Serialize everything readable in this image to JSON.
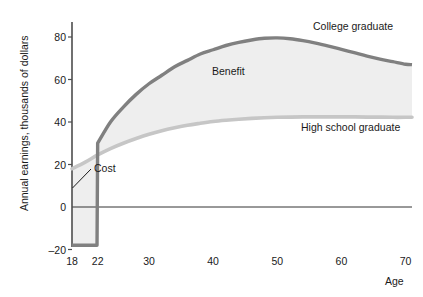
{
  "chart_data": {
    "type": "area",
    "title": "",
    "xlabel": "Age",
    "ylabel": "Annual earnings, thousands of dollars",
    "xlim": [
      18,
      71
    ],
    "ylim": [
      -20,
      85
    ],
    "grid": false,
    "legend_position": "inline-right",
    "xticks": [
      {
        "value": 18,
        "label": "18"
      },
      {
        "value": 22,
        "label": "22"
      },
      {
        "value": 30,
        "label": "30"
      },
      {
        "value": 40,
        "label": "40"
      },
      {
        "value": 50,
        "label": "50"
      },
      {
        "value": 60,
        "label": "60"
      },
      {
        "value": 70,
        "label": "70"
      }
    ],
    "yticks": [
      {
        "value": -20,
        "label": "–20"
      },
      {
        "value": 0,
        "label": "0"
      },
      {
        "value": 20,
        "label": "20"
      },
      {
        "value": 40,
        "label": "40"
      },
      {
        "value": 60,
        "label": "60"
      },
      {
        "value": 80,
        "label": "80"
      }
    ],
    "series": [
      {
        "name": "College graduate",
        "color": "#808080",
        "x": [
          18,
          19,
          20,
          21,
          21.9,
          22,
          24,
          26,
          28,
          30,
          32,
          34,
          36,
          38,
          40,
          42,
          44,
          46,
          48,
          50,
          52,
          54,
          56,
          58,
          60,
          62,
          64,
          66,
          68,
          70,
          71
        ],
        "values": [
          -18,
          -18,
          -18,
          -18,
          -18,
          30,
          40,
          47,
          53,
          58,
          62,
          66,
          69,
          72,
          74,
          76,
          77.5,
          78.6,
          79.4,
          79.6,
          79.2,
          78.3,
          77.1,
          75.7,
          74.2,
          72.6,
          71.0,
          69.6,
          68.4,
          67.2,
          67.0
        ]
      },
      {
        "name": "High school graduate",
        "color": "#c6c6c6",
        "x": [
          18,
          20,
          22,
          24,
          26,
          28,
          30,
          32,
          34,
          36,
          38,
          40,
          42,
          44,
          46,
          48,
          50,
          52,
          54,
          56,
          58,
          60,
          62,
          64,
          66,
          68,
          70,
          71
        ],
        "values": [
          18,
          21,
          24.5,
          27.5,
          30,
          32.2,
          34.2,
          35.9,
          37.3,
          38.5,
          39.4,
          40.2,
          40.8,
          41.3,
          41.7,
          42.0,
          42.2,
          42.3,
          42.4,
          42.4,
          42.4,
          42.4,
          42.4,
          42.3,
          42.3,
          42.2,
          42.2,
          42.2
        ]
      }
    ],
    "regions": [
      {
        "name": "Benefit",
        "label": "Benefit",
        "fill": "#eeeeee",
        "between": [
          "College graduate",
          "High school graduate"
        ],
        "from_x": 22,
        "to_x": 71
      },
      {
        "name": "Cost",
        "label": "Cost",
        "fill": "#eeeeee",
        "between": [
          "High school graduate",
          "College graduate"
        ],
        "from_x": 18,
        "to_x": 22
      }
    ],
    "annotations": [
      {
        "name": "benefit-label",
        "text": "Benefit",
        "x": 40.5,
        "y": 62
      },
      {
        "name": "cost-label",
        "text": "Cost",
        "x": 24.5,
        "y": 18.5
      },
      {
        "name": "college-graduate-label",
        "text": "College graduate",
        "x": 57,
        "y": 88
      },
      {
        "name": "high-school-graduate-label",
        "text": "High school graduate",
        "x": 57,
        "y": 37
      }
    ],
    "zero_line": 0,
    "colors": {
      "college_line": "#808080",
      "high_school_line": "#c6c6c6",
      "fill": "#eeeeee",
      "axis": "#4d4d4d",
      "zero_line": "#333333",
      "text": "#1a1a1a",
      "background": "#ffffff"
    }
  },
  "labels": {
    "y_axis_title": "Annual earnings, thousands of dollars",
    "x_axis_title": "Age",
    "benefit": "Benefit",
    "cost": "Cost",
    "college_graduate": "College graduate",
    "high_school_graduate": "High school graduate",
    "y_ticks": {
      "t_minus20": "–20",
      "t_0": "0",
      "t_20": "20",
      "t_40": "40",
      "t_60": "60",
      "t_80": "80"
    },
    "x_ticks": {
      "t_18": "18",
      "t_22": "22",
      "t_30": "30",
      "t_40": "40",
      "t_50": "50",
      "t_60": "60",
      "t_70": "70"
    }
  }
}
